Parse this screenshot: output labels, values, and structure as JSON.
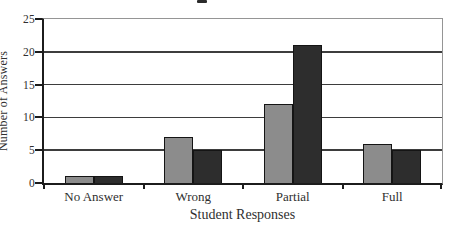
{
  "chart_data": {
    "type": "bar",
    "categories": [
      "No Answer",
      "Wrong",
      "Partial",
      "Full"
    ],
    "series": [
      {
        "name": "gray-series",
        "color": "#8c8c8c",
        "values": [
          1,
          7,
          12,
          6
        ]
      },
      {
        "name": "dark-series",
        "color": "#2d2d2d",
        "values": [
          1,
          5,
          21,
          5
        ]
      }
    ],
    "title": "",
    "xlabel": "Student Responses",
    "ylabel": "Number of Answers",
    "ylim": [
      0,
      25
    ],
    "yticks": [
      0,
      5,
      10,
      15,
      20,
      25
    ],
    "grid": "horizontal",
    "legend": "none",
    "colors": {
      "bar_border": "#141414",
      "gridline": "#3d3d3d",
      "axis": "#1c1c1c",
      "frame": "#959595",
      "text": "#2f2f2f",
      "background": "#ffffff"
    }
  }
}
